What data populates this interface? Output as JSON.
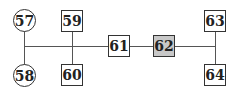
{
  "diagram": {
    "type": "pedigree-tree",
    "nodes": [
      {
        "id": "57",
        "label": "57",
        "shape": "circle",
        "highlighted": false
      },
      {
        "id": "58",
        "label": "58",
        "shape": "circle",
        "highlighted": false
      },
      {
        "id": "59",
        "label": "59",
        "shape": "square",
        "highlighted": false
      },
      {
        "id": "60",
        "label": "60",
        "shape": "square",
        "highlighted": false
      },
      {
        "id": "61",
        "label": "61",
        "shape": "square",
        "highlighted": false
      },
      {
        "id": "62",
        "label": "62",
        "shape": "square",
        "highlighted": true
      },
      {
        "id": "63",
        "label": "63",
        "shape": "square",
        "highlighted": false
      },
      {
        "id": "64",
        "label": "64",
        "shape": "square",
        "highlighted": false
      }
    ],
    "edges": [
      [
        "57",
        "58"
      ],
      [
        "59",
        "60"
      ],
      [
        "57-58",
        "61"
      ],
      [
        "59-60",
        "61"
      ],
      [
        "61",
        "62"
      ],
      [
        "62",
        "63-64"
      ],
      [
        "63",
        "64"
      ]
    ],
    "colors": {
      "highlight_fill": "#c8c8c8",
      "stroke": "#333333",
      "line": "#555555"
    }
  }
}
